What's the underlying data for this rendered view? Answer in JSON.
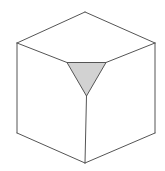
{
  "figure": {
    "canvas": {
      "width": 165,
      "height": 171,
      "background": "#ffffff"
    },
    "style": {
      "edge_color": "#555555",
      "edge_width": 1,
      "face_fill": "#ffffff",
      "notch_fill": "#d2d2d2",
      "notch_stroke": "#555555"
    },
    "vertices": {
      "top": {
        "x": 85,
        "y": 12
      },
      "left": {
        "x": 17,
        "y": 43
      },
      "right": {
        "x": 155,
        "y": 43
      },
      "bottom_left": {
        "x": 17,
        "y": 133
      },
      "bottom_right": {
        "x": 155,
        "y": 133
      },
      "bottom": {
        "x": 85,
        "y": 163
      },
      "center": {
        "x": 86.5,
        "y": 96
      }
    },
    "notch_triangle": {
      "shape": "inverted-triangle",
      "fill": "#d2d2d2",
      "points": [
        {
          "x": 67,
          "y": 62.5
        },
        {
          "x": 106,
          "y": 62.5
        },
        {
          "x": 86.5,
          "y": 96
        }
      ]
    },
    "faces": [
      {
        "name": "top-face",
        "fill": "#ffffff",
        "points": [
          {
            "x": 85,
            "y": 12
          },
          {
            "x": 155,
            "y": 43
          },
          {
            "x": 106,
            "y": 62.5
          },
          {
            "x": 67,
            "y": 62.5
          },
          {
            "x": 17,
            "y": 43
          }
        ]
      },
      {
        "name": "left-face",
        "fill": "#ffffff",
        "points": [
          {
            "x": 17,
            "y": 43
          },
          {
            "x": 67,
            "y": 62.5
          },
          {
            "x": 86.5,
            "y": 96
          },
          {
            "x": 85,
            "y": 163
          },
          {
            "x": 17,
            "y": 133
          }
        ]
      },
      {
        "name": "right-face",
        "fill": "#ffffff",
        "points": [
          {
            "x": 155,
            "y": 43
          },
          {
            "x": 155,
            "y": 133
          },
          {
            "x": 85,
            "y": 163
          },
          {
            "x": 86.5,
            "y": 96
          },
          {
            "x": 106,
            "y": 62.5
          }
        ]
      }
    ],
    "edges": [
      {
        "name": "top-to-left",
        "from": {
          "x": 85,
          "y": 12
        },
        "to": {
          "x": 17,
          "y": 43
        }
      },
      {
        "name": "top-to-right",
        "from": {
          "x": 85,
          "y": 12
        },
        "to": {
          "x": 155,
          "y": 43
        }
      },
      {
        "name": "left-vertical",
        "from": {
          "x": 17,
          "y": 43
        },
        "to": {
          "x": 17,
          "y": 133
        }
      },
      {
        "name": "right-vertical",
        "from": {
          "x": 155,
          "y": 43
        },
        "to": {
          "x": 155,
          "y": 133
        }
      },
      {
        "name": "bottom-left-to-bottom",
        "from": {
          "x": 17,
          "y": 133
        },
        "to": {
          "x": 85,
          "y": 163
        }
      },
      {
        "name": "bottom-right-to-bottom",
        "from": {
          "x": 155,
          "y": 133
        },
        "to": {
          "x": 85,
          "y": 163
        }
      },
      {
        "name": "left-to-notch-left",
        "from": {
          "x": 17,
          "y": 43
        },
        "to": {
          "x": 67,
          "y": 62.5
        }
      },
      {
        "name": "right-to-notch-right",
        "from": {
          "x": 155,
          "y": 43
        },
        "to": {
          "x": 106,
          "y": 62.5
        }
      },
      {
        "name": "center-vertical",
        "from": {
          "x": 86.5,
          "y": 96
        },
        "to": {
          "x": 85,
          "y": 163
        }
      }
    ]
  }
}
